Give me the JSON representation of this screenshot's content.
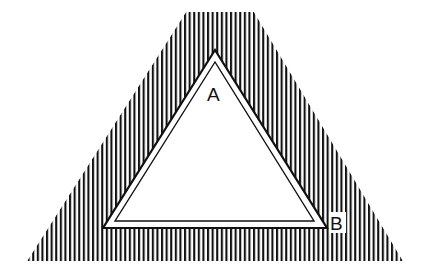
{
  "diagram": {
    "labels": {
      "a": "A",
      "b": "B"
    },
    "colors": {
      "ink": "#111111",
      "background": "#ffffff"
    },
    "hatch": {
      "spacing_px": 4.6,
      "stroke_width_px": 2
    },
    "outer_region": {
      "points": [
        [
          186,
          12
        ],
        [
          254,
          12
        ],
        [
          403,
          261
        ],
        [
          27,
          261
        ]
      ]
    },
    "triangle_outer": {
      "points": [
        [
          215,
          50
        ],
        [
          103,
          228
        ],
        [
          327,
          228
        ]
      ]
    },
    "triangle_inner": {
      "points": [
        [
          215,
          62
        ],
        [
          115,
          221
        ],
        [
          314,
          221
        ]
      ]
    }
  }
}
